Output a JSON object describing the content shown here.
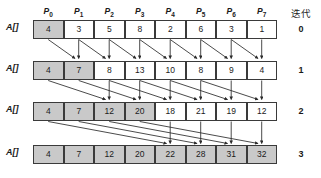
{
  "diagram": {
    "title_col_iteration": "迭代",
    "row_label": "A[]",
    "column_headers": [
      {
        "base": "P",
        "sub": "0"
      },
      {
        "base": "P",
        "sub": "1"
      },
      {
        "base": "P",
        "sub": "2"
      },
      {
        "base": "P",
        "sub": "3"
      },
      {
        "base": "P",
        "sub": "4"
      },
      {
        "base": "P",
        "sub": "5"
      },
      {
        "base": "P",
        "sub": "6"
      },
      {
        "base": "P",
        "sub": "7"
      }
    ],
    "rows": [
      {
        "iteration": "0",
        "label": "A[]",
        "values": [
          "4",
          "3",
          "5",
          "8",
          "2",
          "6",
          "3",
          "1"
        ],
        "shaded": [
          true,
          false,
          false,
          false,
          false,
          false,
          false,
          false
        ]
      },
      {
        "iteration": "1",
        "label": "A[]",
        "values": [
          "4",
          "7",
          "8",
          "13",
          "10",
          "8",
          "9",
          "4"
        ],
        "shaded": [
          true,
          true,
          false,
          false,
          false,
          false,
          false,
          false
        ]
      },
      {
        "iteration": "2",
        "label": "A[]",
        "values": [
          "4",
          "7",
          "12",
          "20",
          "18",
          "21",
          "19",
          "12"
        ],
        "shaded": [
          true,
          true,
          true,
          true,
          false,
          false,
          false,
          false
        ]
      },
      {
        "iteration": "3",
        "label": "A[]",
        "values": [
          "4",
          "7",
          "12",
          "20",
          "22",
          "28",
          "31",
          "32"
        ],
        "shaded": [
          true,
          true,
          true,
          true,
          true,
          true,
          true,
          true
        ]
      }
    ],
    "colors": {
      "shaded_fill": "#c9c9c9",
      "cell_border": "#3a3a3a",
      "arrow": "#2b2b2b",
      "background": "#ffffff"
    },
    "arrow_groups": [
      {
        "from_row": "0",
        "to_row": "1",
        "stride": 1
      },
      {
        "from_row": "1",
        "to_row": "2",
        "stride": 2
      },
      {
        "from_row": "2",
        "to_row": "3",
        "stride": 4
      }
    ]
  }
}
